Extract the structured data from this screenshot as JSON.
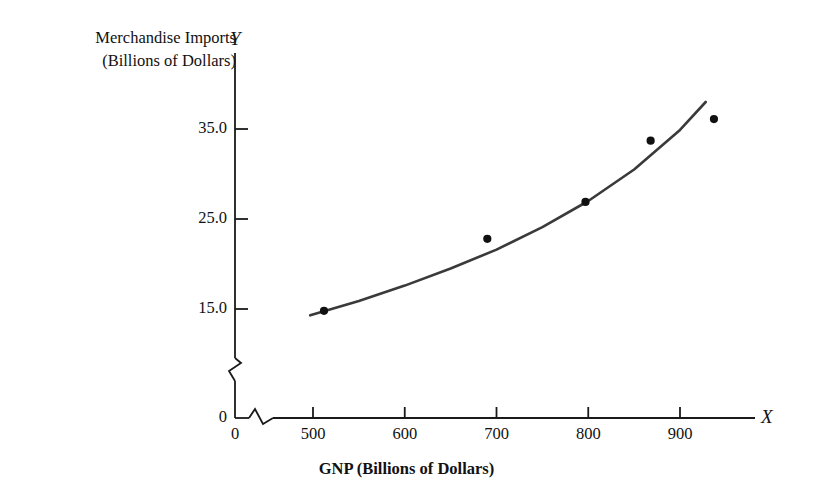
{
  "figure": {
    "y_axis_title_line1": "Merchandise Imports",
    "y_axis_title_line2": "(Billions of Dollars)",
    "y_axis_letter": "Y",
    "x_axis_letter": "X",
    "x_axis_title": "GNP (Billions of Dollars)"
  },
  "chart_data": {
    "type": "scatter",
    "title": "",
    "subtitle": "",
    "xlabel": "GNP (Billions of Dollars)",
    "ylabel": "Merchandise Imports (Billions of Dollars)",
    "x_axis_symbol": "X",
    "y_axis_symbol": "Y",
    "grid": false,
    "legend": "none",
    "axis_break_x": true,
    "axis_break_y": true,
    "xlim": [
      0,
      960
    ],
    "ylim": [
      0,
      41
    ],
    "x_plot_start": 440,
    "xticks": [
      0,
      500,
      600,
      700,
      800,
      900
    ],
    "xticklabels": [
      "0",
      "500",
      "600",
      "700",
      "800",
      "900"
    ],
    "yticks": [
      0,
      15.0,
      25.0,
      35.0
    ],
    "yticklabels": [
      "0",
      "15.0",
      "25.0",
      "35.0"
    ],
    "points": [
      {
        "x": 512,
        "y": 14.8
      },
      {
        "x": 690,
        "y": 22.8
      },
      {
        "x": 797,
        "y": 26.9
      },
      {
        "x": 868,
        "y": 33.7
      },
      {
        "x": 937,
        "y": 36.1
      }
    ],
    "fitted_curve": {
      "label": "fitted exponential regression curve",
      "x": [
        497,
        550,
        600,
        650,
        700,
        750,
        800,
        850,
        900,
        928
      ],
      "y": [
        14.3,
        15.9,
        17.6,
        19.5,
        21.6,
        24.1,
        27.0,
        30.5,
        34.9,
        38.0
      ]
    },
    "marker_color": "#111111",
    "curve_color": "#3a3a3a",
    "axis_color": "#1a1a1a"
  }
}
